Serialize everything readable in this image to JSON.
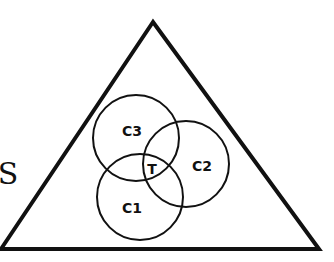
{
  "diagram": {
    "type": "venn-in-triangle",
    "universe": {
      "label": "S",
      "shape": "triangle",
      "vertices": [
        [
          153,
          22
        ],
        [
          1,
          249
        ],
        [
          319,
          249
        ]
      ],
      "label_pos": [
        8,
        184
      ]
    },
    "circles": [
      {
        "id": "c3",
        "label": "C3",
        "cx": 136,
        "cy": 138,
        "r": 43,
        "label_pos": [
          132,
          136
        ]
      },
      {
        "id": "c2",
        "label": "C2",
        "cx": 186,
        "cy": 164,
        "r": 43,
        "label_pos": [
          202,
          171
        ]
      },
      {
        "id": "c1",
        "label": "C1",
        "cx": 140,
        "cy": 197,
        "r": 43,
        "label_pos": [
          132,
          213
        ]
      }
    ],
    "intersection": {
      "label": "T",
      "label_pos": [
        152,
        174
      ]
    },
    "colors": {
      "stroke": "#111111",
      "background": "#ffffff"
    }
  }
}
